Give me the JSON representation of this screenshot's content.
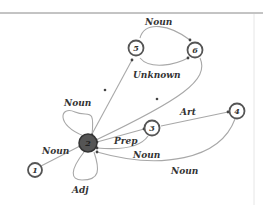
{
  "diagram": {
    "type": "state-transition-graph",
    "nodes": [
      {
        "id": "1",
        "label": "1",
        "x": 35,
        "y": 170,
        "highlighted": false
      },
      {
        "id": "2",
        "label": "2",
        "x": 88,
        "y": 143,
        "highlighted": true
      },
      {
        "id": "3",
        "label": "3",
        "x": 152,
        "y": 128,
        "highlighted": false
      },
      {
        "id": "4",
        "label": "4",
        "x": 237,
        "y": 111,
        "highlighted": false
      },
      {
        "id": "5",
        "label": "5",
        "x": 136,
        "y": 48,
        "highlighted": false
      },
      {
        "id": "6",
        "label": "6",
        "x": 195,
        "y": 50,
        "highlighted": false
      }
    ],
    "edges": [
      {
        "from": "1",
        "to": "2",
        "label": "Noun"
      },
      {
        "from": "2",
        "to": "2",
        "label": "Noun"
      },
      {
        "from": "2",
        "to": "2",
        "label": "Adj"
      },
      {
        "from": "2",
        "to": "5",
        "label": "*"
      },
      {
        "from": "6",
        "to": "2",
        "label": "*"
      },
      {
        "from": "3",
        "to": "2",
        "label": "Prep"
      },
      {
        "from": "3",
        "to": "2",
        "label": "Noun"
      },
      {
        "from": "3",
        "to": "4",
        "label": "Art"
      },
      {
        "from": "4",
        "to": "2",
        "label": "Noun"
      },
      {
        "from": "5",
        "to": "6",
        "label": "Noun"
      },
      {
        "from": "5",
        "to": "6",
        "label": "Unknown"
      }
    ],
    "labels": {
      "noun_56": "Noun",
      "unknown_56": "Unknown",
      "star_25": "*",
      "star_62": "*",
      "noun_loop": "Noun",
      "art_34": "Art",
      "prep_32": "Prep",
      "noun_32": "Noun",
      "noun_12": "Noun",
      "noun_42": "Noun",
      "adj_loop": "Adj"
    },
    "colors": {
      "edge": "#a8a8a8",
      "node_stroke": "#555555",
      "hub_fill": "#555555",
      "frame": "#888888"
    }
  }
}
